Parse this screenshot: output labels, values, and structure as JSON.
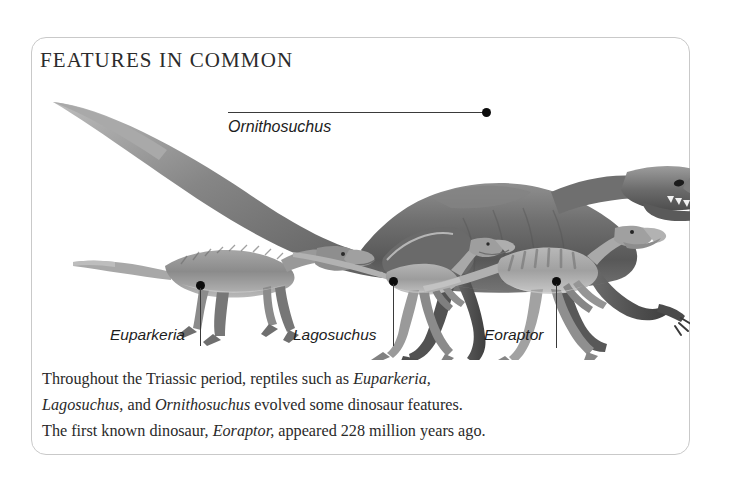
{
  "card": {
    "title": "FEATURES IN COMMON"
  },
  "labels": {
    "ornithosuchus": "Ornithosuchus",
    "euparkeria": "Euparkeria",
    "lagosuchus": "Lagosuchus",
    "eoraptor": "Eoraptor"
  },
  "caption": {
    "line1_a": "Throughout the Triassic period, reptiles such as ",
    "line1_i": "Euparkeria,",
    "line2_i1": "Lagosuchus,",
    "line2_a": " and ",
    "line2_i2": "Ornithosuchus",
    "line2_b": " evolved some dinosaur features.",
    "line3_a": "The first known dinosaur, ",
    "line3_i": "Eoraptor,",
    "line3_b": " appeared 228 million years ago."
  },
  "figure": {
    "type": "comparative-scale-illustration",
    "animals": [
      {
        "name": "Ornithosuchus",
        "pose": "quadrupedal-walking",
        "relative_size": "largest",
        "shade": "#6d6d6d"
      },
      {
        "name": "Euparkeria",
        "pose": "quadrupedal-walking",
        "relative_size": "small",
        "shade": "#8a8a8a"
      },
      {
        "name": "Lagosuchus",
        "pose": "bipedal-striding",
        "relative_size": "smallest",
        "shade": "#9a9a9a"
      },
      {
        "name": "Eoraptor",
        "pose": "bipedal-running",
        "relative_size": "small",
        "shade": "#9e9e9e"
      }
    ]
  },
  "colors": {
    "card_border": "#c9c9c9",
    "title_text": "#2b2b2b",
    "body_text": "#2a2a2a",
    "leader": "#3a3a3a",
    "background": "#ffffff"
  }
}
